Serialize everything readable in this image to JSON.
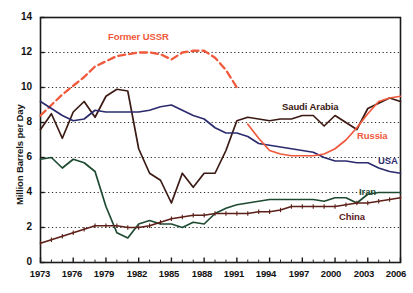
{
  "chart_data": {
    "type": "line",
    "title": "",
    "xlabel": "",
    "ylabel": "Million Barrels per Day",
    "xlim": [
      1973,
      2006
    ],
    "ylim": [
      0,
      14
    ],
    "ytick_values": [
      0,
      2,
      4,
      6,
      8,
      10,
      12,
      14
    ],
    "xtick_values": [
      1973,
      1976,
      1979,
      1982,
      1985,
      1988,
      1991,
      1994,
      1997,
      2000,
      2003,
      2006
    ],
    "ytick_labels": [
      "0",
      "2",
      "4",
      "6",
      "8",
      "10",
      "12",
      "14"
    ],
    "xtick_labels": [
      "1973",
      "1976",
      "1979",
      "1982",
      "1985",
      "1988",
      "1991",
      "1994",
      "1997",
      "2000",
      "2003",
      "2006"
    ],
    "grid": "horizontal-dotted",
    "legend_position": "inline-annotations",
    "x": [
      1973,
      1974,
      1975,
      1976,
      1977,
      1978,
      1979,
      1980,
      1981,
      1982,
      1983,
      1984,
      1985,
      1986,
      1987,
      1988,
      1989,
      1990,
      1991,
      1992,
      1993,
      1994,
      1995,
      1996,
      1997,
      1998,
      1999,
      2000,
      2001,
      2002,
      2003,
      2004,
      2005,
      2006
    ],
    "series": [
      {
        "name": "Former USSR",
        "color": "#F0593C",
        "style": "dashed",
        "x": [
          1973,
          1974,
          1975,
          1976,
          1977,
          1978,
          1979,
          1980,
          1981,
          1982,
          1983,
          1984,
          1985,
          1986,
          1987,
          1988,
          1989,
          1990,
          1991
        ],
        "values": [
          8.4,
          9.0,
          9.6,
          10.1,
          10.6,
          11.2,
          11.5,
          11.8,
          11.9,
          12.0,
          12.0,
          11.9,
          11.6,
          12.0,
          12.1,
          12.1,
          11.7,
          11.0,
          10.0
        ]
      },
      {
        "name": "Saudi Arabia",
        "color": "#3B1A14",
        "style": "solid",
        "x": [
          1973,
          1974,
          1975,
          1976,
          1977,
          1978,
          1979,
          1980,
          1981,
          1982,
          1983,
          1984,
          1985,
          1986,
          1987,
          1988,
          1989,
          1990,
          1991,
          1992,
          1993,
          1994,
          1995,
          1996,
          1997,
          1998,
          1999,
          2000,
          2001,
          2002,
          2003,
          2004,
          2005,
          2006
        ],
        "values": [
          7.6,
          8.5,
          7.1,
          8.6,
          9.2,
          8.3,
          9.5,
          9.9,
          9.8,
          6.5,
          5.1,
          4.7,
          3.4,
          5.1,
          4.3,
          5.1,
          5.1,
          6.4,
          8.1,
          8.3,
          8.2,
          8.1,
          8.2,
          8.2,
          8.4,
          8.4,
          7.8,
          8.4,
          8.0,
          7.6,
          8.8,
          9.1,
          9.4,
          9.2
        ]
      },
      {
        "name": "USA",
        "color": "#2B2B6E",
        "style": "solid",
        "x": [
          1973,
          1974,
          1975,
          1976,
          1977,
          1978,
          1979,
          1980,
          1981,
          1982,
          1983,
          1984,
          1985,
          1986,
          1987,
          1988,
          1989,
          1990,
          1991,
          1992,
          1993,
          1994,
          1995,
          1996,
          1997,
          1998,
          1999,
          2000,
          2001,
          2002,
          2003,
          2004,
          2005,
          2006
        ],
        "values": [
          9.2,
          8.8,
          8.4,
          8.1,
          8.2,
          8.7,
          8.6,
          8.6,
          8.6,
          8.6,
          8.7,
          8.9,
          9.0,
          8.7,
          8.4,
          8.2,
          7.7,
          7.4,
          7.4,
          7.2,
          6.8,
          6.7,
          6.6,
          6.5,
          6.4,
          6.3,
          6.0,
          5.8,
          5.8,
          5.7,
          5.7,
          5.4,
          5.2,
          5.1
        ]
      },
      {
        "name": "Russia",
        "color": "#F0593C",
        "style": "solid",
        "x": [
          1992,
          1993,
          1994,
          1995,
          1996,
          1997,
          1998,
          1999,
          2000,
          2001,
          2002,
          2003,
          2004,
          2005,
          2006
        ],
        "values": [
          7.9,
          7.1,
          6.4,
          6.2,
          6.1,
          6.1,
          6.1,
          6.2,
          6.5,
          7.0,
          7.7,
          8.5,
          9.2,
          9.4,
          9.5
        ]
      },
      {
        "name": "Iran",
        "color": "#1E4A32",
        "style": "solid",
        "x": [
          1973,
          1974,
          1975,
          1976,
          1977,
          1978,
          1979,
          1980,
          1981,
          1982,
          1983,
          1984,
          1985,
          1986,
          1987,
          1988,
          1989,
          1990,
          1991,
          1992,
          1993,
          1994,
          1995,
          1996,
          1997,
          1998,
          1999,
          2000,
          2001,
          2002,
          2003,
          2004,
          2005,
          2006
        ],
        "values": [
          5.9,
          6.0,
          5.4,
          5.9,
          5.7,
          5.2,
          3.2,
          1.7,
          1.4,
          2.2,
          2.4,
          2.2,
          2.2,
          2.0,
          2.3,
          2.2,
          2.8,
          3.1,
          3.3,
          3.4,
          3.5,
          3.6,
          3.6,
          3.6,
          3.6,
          3.6,
          3.5,
          3.7,
          3.7,
          3.4,
          3.9,
          4.0,
          4.0,
          4.0
        ]
      },
      {
        "name": "China",
        "color": "#5C2018",
        "style": "solid-with-markers",
        "x": [
          1973,
          1974,
          1975,
          1976,
          1977,
          1978,
          1979,
          1980,
          1981,
          1982,
          1983,
          1984,
          1985,
          1986,
          1987,
          1988,
          1989,
          1990,
          1991,
          1992,
          1993,
          1994,
          1995,
          1996,
          1997,
          1998,
          1999,
          2000,
          2001,
          2002,
          2003,
          2004,
          2005,
          2006
        ],
        "values": [
          1.1,
          1.3,
          1.5,
          1.7,
          1.9,
          2.1,
          2.1,
          2.1,
          2.0,
          2.0,
          2.1,
          2.3,
          2.5,
          2.6,
          2.7,
          2.7,
          2.8,
          2.8,
          2.8,
          2.8,
          2.9,
          2.9,
          3.0,
          3.2,
          3.2,
          3.2,
          3.2,
          3.2,
          3.3,
          3.4,
          3.4,
          3.5,
          3.6,
          3.7
        ]
      }
    ],
    "annotations": [
      {
        "text": "Former USSR",
        "color": "#F0593C",
        "x_px": 108,
        "y_px": 31
      },
      {
        "text": "Saudi Arabia",
        "color": "#3B1A14",
        "x_px": 282,
        "y_px": 101
      },
      {
        "text": "Russia",
        "color": "#F0593C",
        "x_px": 357,
        "y_px": 130
      },
      {
        "text": "USA",
        "color": "#2B2B6E",
        "x_px": 377,
        "y_px": 155
      },
      {
        "text": "Iran",
        "color": "#1E4A32",
        "x_px": 358,
        "y_px": 186
      },
      {
        "text": "China",
        "color": "#5C2018",
        "x_px": 339,
        "y_px": 211
      }
    ]
  },
  "axis": {
    "ylabel": "Million Barrels per Day",
    "yticks": [
      "14",
      "12",
      "10",
      "8",
      "6",
      "4",
      "2",
      "0"
    ],
    "xticks": [
      "1973",
      "1976",
      "1979",
      "1982",
      "1985",
      "1988",
      "1991",
      "1994",
      "1997",
      "2000",
      "2003",
      "2006"
    ]
  },
  "labels": {
    "former_ussr": "Former USSR",
    "saudi_arabia": "Saudi Arabia",
    "russia": "Russia",
    "usa": "USA",
    "iran": "Iran",
    "china": "China"
  },
  "colors": {
    "former_ussr": "#F0593C",
    "saudi_arabia": "#3B1A14",
    "russia": "#F0593C",
    "usa": "#2B2B6E",
    "iran": "#1E4A32",
    "china": "#5C2018",
    "axis": "#1a1a1a",
    "grid": "#2b2b2b",
    "background": "#ffffff"
  }
}
